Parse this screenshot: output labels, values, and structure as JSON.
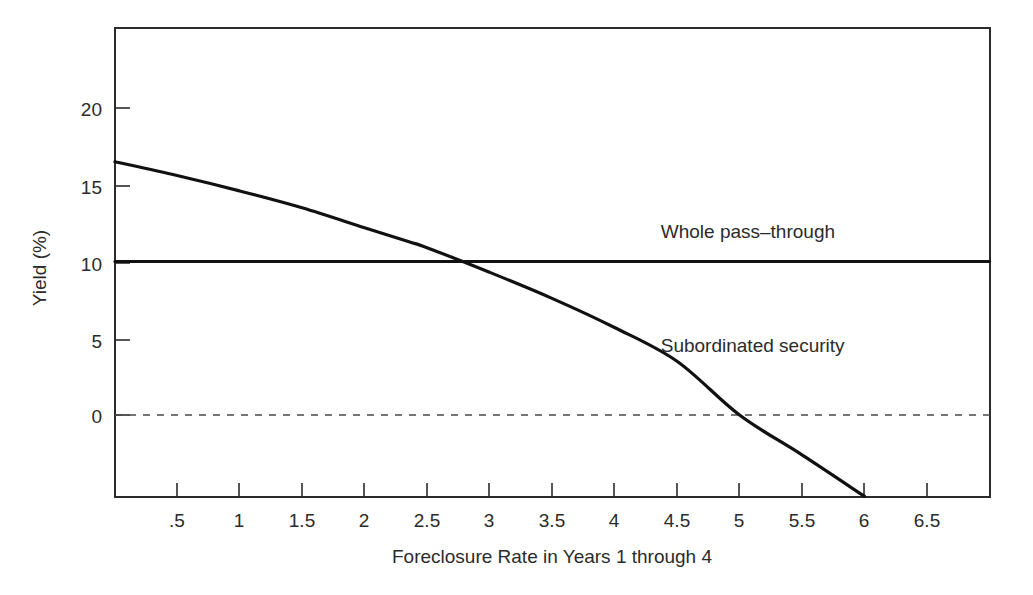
{
  "chart_data": {
    "type": "line",
    "title": "",
    "subtitle": "",
    "xlabel": "Foreclosure Rate in Years 1 through 4",
    "ylabel": "Yield (%)",
    "xlim": [
      0,
      7.0
    ],
    "ylim": [
      -5.5,
      24.5
    ],
    "grid": false,
    "legend_position": "inline-annotation",
    "x_ticks": [
      0.5,
      1,
      1.5,
      2,
      2.5,
      3,
      3.5,
      4,
      4.5,
      5,
      5.5,
      6,
      6.5
    ],
    "x_tick_labels": [
      ".5",
      "1",
      "1.5",
      "2",
      "2.5",
      "3",
      "3.5",
      "4",
      "4.5",
      "5",
      "5.5",
      "6",
      "6.5"
    ],
    "y_ticks": [
      0,
      5,
      10,
      15,
      20
    ],
    "y_tick_labels": [
      "0",
      "5",
      "10",
      "15",
      "20"
    ],
    "series": [
      {
        "name": "Whole pass-through",
        "label": "Whole pass–through",
        "style": "solid",
        "color": "#111111",
        "x": [
          0,
          7.0
        ],
        "values": [
          10,
          10
        ]
      },
      {
        "name": "Subordinated security",
        "label": "Subordinated security",
        "style": "solid",
        "color": "#111111",
        "x": [
          0,
          0.5,
          1,
          1.5,
          2,
          2.35,
          2.5,
          3,
          3.5,
          4,
          4.5,
          5,
          5.5,
          6
        ],
        "values": [
          16.5,
          15.6,
          14.6,
          13.5,
          12.2,
          11.3,
          10.9,
          9.3,
          7.6,
          5.7,
          3.5,
          0.0,
          -2.6,
          -5.3
        ]
      }
    ],
    "reference_lines": [
      {
        "name": "zero-line",
        "orientation": "horizontal",
        "value": 0,
        "style": "dashed",
        "color": "#4a4a4a"
      }
    ],
    "annotations": [
      {
        "name": "whole-pass-through-label",
        "text": "Whole pass–through",
        "x": 4.37,
        "y": 11.5
      },
      {
        "name": "subordinated-security-label",
        "text": "Subordinated security",
        "x": 4.37,
        "y": 4.1
      }
    ]
  }
}
